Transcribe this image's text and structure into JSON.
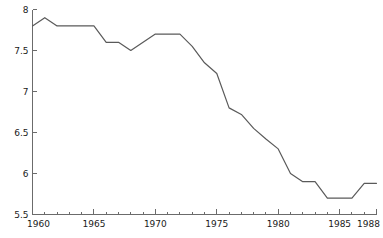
{
  "chart_data": {
    "type": "line",
    "title": "",
    "subtitle": "",
    "xlabel": "",
    "ylabel": "",
    "grid": false,
    "legend": false,
    "legend_position": "none",
    "line_color": "#5a5a5a",
    "axis_color": "#6b6b6b",
    "background_color": "#ffffff",
    "xlim": [
      1960,
      1988
    ],
    "ylim": [
      5.5,
      8
    ],
    "x_tick_labels": [
      "1960",
      "1965",
      "1970",
      "1975",
      "1980",
      "1985",
      "1988"
    ],
    "x_tick_values": [
      1960,
      1965,
      1970,
      1975,
      1980,
      1985,
      1988
    ],
    "x_minor_ticks": [
      1961,
      1962,
      1963,
      1964,
      1966,
      1967,
      1968,
      1969,
      1971,
      1972,
      1973,
      1974,
      1976,
      1977,
      1978,
      1979,
      1981,
      1982,
      1983,
      1984,
      1986,
      1987
    ],
    "y_tick_labels": [
      "5.5",
      "6",
      "6.5",
      "7",
      "7.5",
      "8"
    ],
    "y_tick_values": [
      5.5,
      6,
      6.5,
      7,
      7.5,
      8
    ],
    "x": [
      1960,
      1961,
      1962,
      1963,
      1964,
      1965,
      1966,
      1967,
      1968,
      1969,
      1970,
      1971,
      1972,
      1973,
      1974,
      1975,
      1976,
      1977,
      1978,
      1979,
      1980,
      1981,
      1982,
      1983,
      1984,
      1985,
      1986,
      1987,
      1988
    ],
    "values": [
      7.8,
      7.9,
      7.8,
      7.8,
      7.8,
      7.8,
      7.6,
      7.6,
      7.5,
      7.6,
      7.7,
      7.7,
      7.7,
      7.55,
      7.35,
      7.22,
      6.8,
      6.72,
      6.55,
      6.42,
      6.3,
      6.0,
      5.9,
      5.9,
      5.7,
      5.7,
      5.7,
      5.88,
      5.88
    ],
    "series": [
      {
        "name": "series-1",
        "values": [
          7.8,
          7.9,
          7.8,
          7.8,
          7.8,
          7.8,
          7.6,
          7.6,
          7.5,
          7.6,
          7.7,
          7.7,
          7.7,
          7.55,
          7.35,
          7.22,
          6.8,
          6.72,
          6.55,
          6.42,
          6.3,
          6.0,
          5.9,
          5.9,
          5.7,
          5.7,
          5.7,
          5.88,
          5.88
        ]
      }
    ]
  }
}
